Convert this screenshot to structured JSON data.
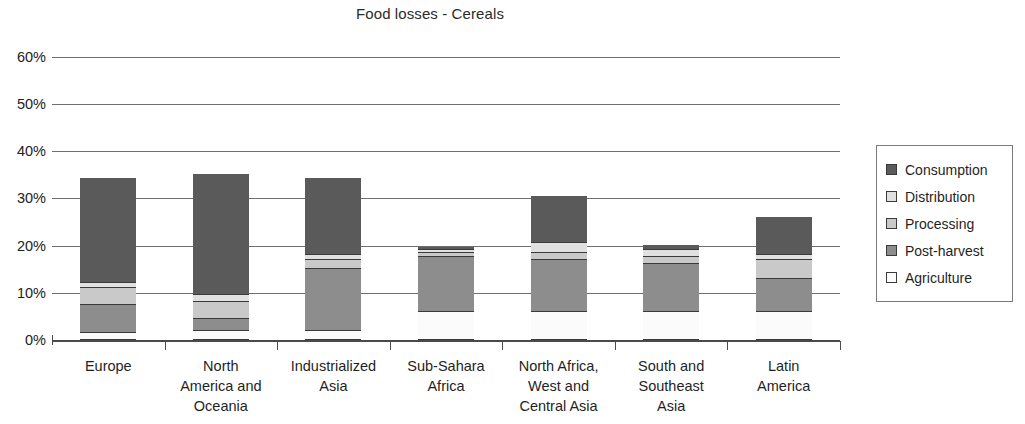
{
  "chart_data": {
    "type": "bar",
    "subtype": "stacked-bar",
    "title": "Food losses - Cereals",
    "xlabel": "",
    "ylabel": "",
    "ylim": [
      0,
      60
    ],
    "ytick_labels": [
      "0%",
      "10%",
      "20%",
      "30%",
      "40%",
      "50%",
      "60%"
    ],
    "ytick_values": [
      0,
      10,
      20,
      30,
      40,
      50,
      60
    ],
    "grid": true,
    "grid_axis": "y",
    "legend_position": "right",
    "stack_order_bottom_to_top": [
      "Agriculture",
      "Post-harvest",
      "Processing",
      "Distribution",
      "Consumption"
    ],
    "categories": [
      "Europe",
      "North America and Oceania",
      "Industrialized Asia",
      "Sub-Sahara Africa",
      "North Africa, West and Central Asia",
      "South and Southeast Asia",
      "Latin America"
    ],
    "category_label_lines": [
      [
        "Europe"
      ],
      [
        "North",
        "America and",
        "Oceania"
      ],
      [
        "Industrialized",
        "Asia"
      ],
      [
        "Sub-Sahara",
        "Africa"
      ],
      [
        "North Africa,",
        "West and",
        "Central Asia"
      ],
      [
        "South and",
        "Southeast",
        "Asia"
      ],
      [
        "Latin",
        "America"
      ]
    ],
    "series": [
      {
        "name": "Agriculture",
        "color": "#fbfbfb",
        "values": [
          1.5,
          2.0,
          2.0,
          6.0,
          6.0,
          6.0,
          6.0
        ]
      },
      {
        "name": "Post-harvest",
        "color": "#8d8d8d",
        "values": [
          6.0,
          2.5,
          13.0,
          11.5,
          11.0,
          10.0,
          7.0
        ]
      },
      {
        "name": "Processing",
        "color": "#c9c9c9",
        "values": [
          3.5,
          3.5,
          2.0,
          1.0,
          1.5,
          1.5,
          4.0
        ]
      },
      {
        "name": "Distribution",
        "color": "#e0e0e0",
        "values": [
          1.0,
          1.5,
          1.0,
          0.5,
          2.0,
          1.5,
          1.0
        ]
      },
      {
        "name": "Consumption",
        "color": "#5a5a5a",
        "values": [
          22.3,
          25.6,
          16.3,
          0.6,
          10.0,
          1.1,
          8.0
        ]
      }
    ],
    "totals": [
      34.3,
      35.1,
      34.3,
      19.6,
      30.5,
      20.1,
      26.0
    ]
  },
  "legend": {
    "items": [
      {
        "label": "Consumption",
        "color": "#5a5a5a"
      },
      {
        "label": "Distribution",
        "color": "#e0e0e0"
      },
      {
        "label": "Processing",
        "color": "#c9c9c9"
      },
      {
        "label": "Post-harvest",
        "color": "#8d8d8d"
      },
      {
        "label": "Agriculture",
        "color": "#fbfbfb"
      }
    ]
  }
}
